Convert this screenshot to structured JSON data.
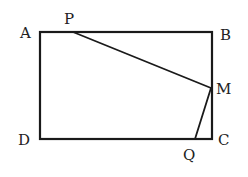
{
  "diagram": {
    "type": "geometry",
    "shape": "rectangle ABCD with points P on AB, M on BC, Q on DC",
    "points": {
      "A": {
        "label": "A",
        "x": 40,
        "y": 32
      },
      "B": {
        "label": "B",
        "x": 212,
        "y": 32
      },
      "C": {
        "label": "C",
        "x": 212,
        "y": 139
      },
      "D": {
        "label": "D",
        "x": 40,
        "y": 139
      },
      "P": {
        "label": "P",
        "x": 73,
        "y": 32
      },
      "M": {
        "label": "M",
        "x": 211,
        "y": 88
      },
      "Q": {
        "label": "Q",
        "x": 195,
        "y": 139
      }
    },
    "segments": [
      "AB",
      "BC",
      "CD",
      "DA",
      "PM",
      "MQ"
    ]
  }
}
